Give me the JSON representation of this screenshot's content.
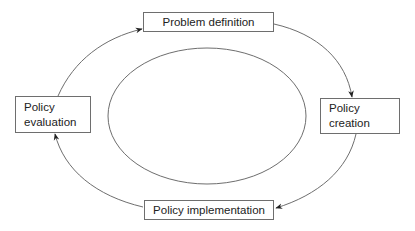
{
  "diagram": {
    "type": "cycle",
    "colors": {
      "line": "#6e6e6e",
      "text": "#222222",
      "background": "#ffffff"
    },
    "nodes": [
      {
        "id": "problem-definition",
        "lines": [
          "Problem definition"
        ],
        "position": "top"
      },
      {
        "id": "policy-creation",
        "lines": [
          "Policy",
          "creation"
        ],
        "position": "right"
      },
      {
        "id": "policy-implementation",
        "lines": [
          "Policy implementation"
        ],
        "position": "bottom"
      },
      {
        "id": "policy-evaluation",
        "lines": [
          "Policy",
          "evaluation"
        ],
        "position": "left"
      }
    ],
    "edges": [
      {
        "from": "problem-definition",
        "to": "policy-creation",
        "direction": "clockwise"
      },
      {
        "from": "policy-creation",
        "to": "policy-implementation",
        "direction": "clockwise"
      },
      {
        "from": "policy-implementation",
        "to": "policy-evaluation",
        "direction": "clockwise"
      },
      {
        "from": "policy-evaluation",
        "to": "problem-definition",
        "direction": "clockwise"
      }
    ],
    "center_shape": "ellipse"
  }
}
